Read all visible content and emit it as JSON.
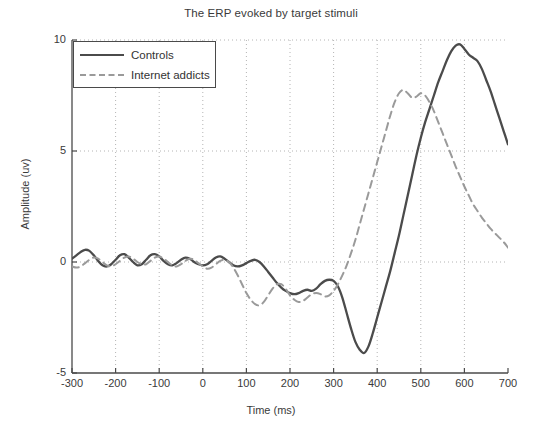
{
  "chart_data": {
    "type": "line",
    "title": "The ERP evoked by target stimuli",
    "xlabel": "Time (ms)",
    "ylabel": "Amplitude (uv)",
    "xlim": [
      -300,
      700
    ],
    "ylim": [
      -5,
      10
    ],
    "xticks": [
      -300,
      -200,
      -100,
      0,
      100,
      200,
      300,
      400,
      500,
      600,
      700
    ],
    "yticks": [
      -5,
      0,
      5,
      10
    ],
    "xtick_labels": [
      "-300",
      "-200",
      "-100",
      "0",
      "100",
      "200",
      "300",
      "400",
      "500",
      "600",
      "700"
    ],
    "ytick_labels": [
      "-5",
      "0",
      "5",
      "10"
    ],
    "grid": true,
    "grid_style": "dotted",
    "legend_position": "top-left",
    "series": [
      {
        "name": "Controls",
        "style": "solid",
        "color": "#4b4b4b",
        "x": [
          -300,
          -290,
          -280,
          -270,
          -260,
          -250,
          -240,
          -230,
          -220,
          -210,
          -200,
          -190,
          -180,
          -170,
          -160,
          -150,
          -140,
          -130,
          -120,
          -110,
          -100,
          -90,
          -80,
          -70,
          -60,
          -50,
          -40,
          -30,
          -20,
          -10,
          0,
          10,
          20,
          30,
          40,
          50,
          60,
          70,
          80,
          90,
          100,
          110,
          120,
          130,
          140,
          150,
          160,
          170,
          180,
          190,
          200,
          210,
          220,
          230,
          240,
          250,
          260,
          270,
          280,
          290,
          300,
          310,
          320,
          330,
          340,
          350,
          360,
          370,
          380,
          390,
          400,
          410,
          420,
          430,
          440,
          450,
          460,
          470,
          480,
          490,
          500,
          510,
          520,
          530,
          540,
          550,
          560,
          570,
          580,
          590,
          600,
          610,
          620,
          630,
          640,
          650,
          660,
          670,
          680,
          690,
          700
        ],
        "y": [
          0.15,
          0.3,
          0.45,
          0.55,
          0.5,
          0.3,
          0.05,
          -0.15,
          -0.2,
          -0.1,
          0.1,
          0.3,
          0.35,
          0.2,
          0.0,
          -0.15,
          -0.1,
          0.1,
          0.3,
          0.35,
          0.25,
          0.05,
          -0.1,
          -0.15,
          -0.05,
          0.1,
          0.2,
          0.15,
          0.0,
          -0.1,
          -0.15,
          -0.1,
          0.05,
          0.2,
          0.25,
          0.15,
          0.0,
          -0.15,
          -0.2,
          -0.15,
          -0.05,
          0.05,
          0.1,
          0.0,
          -0.2,
          -0.45,
          -0.7,
          -0.95,
          -1.15,
          -1.3,
          -1.4,
          -1.45,
          -1.4,
          -1.3,
          -1.25,
          -1.3,
          -1.2,
          -1.0,
          -0.85,
          -0.8,
          -0.85,
          -1.1,
          -1.6,
          -2.3,
          -3.0,
          -3.6,
          -3.95,
          -4.1,
          -3.8,
          -3.2,
          -2.5,
          -1.8,
          -1.1,
          -0.4,
          0.4,
          1.2,
          2.1,
          3.0,
          3.9,
          4.8,
          5.6,
          6.3,
          6.9,
          7.5,
          8.1,
          8.6,
          9.1,
          9.5,
          9.75,
          9.8,
          9.6,
          9.35,
          9.2,
          9.05,
          8.7,
          8.2,
          7.7,
          7.1,
          6.5,
          5.9,
          5.3
        ],
        "peak_label": "P300 peak ~9.8 uv near 400 ms",
        "trough_label": "N2 trough ~-4.1 uv near 160 ms"
      },
      {
        "name": "Internet addicts",
        "style": "dashed",
        "color": "#9a9a9a",
        "x": [
          -300,
          -290,
          -280,
          -270,
          -260,
          -250,
          -240,
          -230,
          -220,
          -210,
          -200,
          -190,
          -180,
          -170,
          -160,
          -150,
          -140,
          -130,
          -120,
          -110,
          -100,
          -90,
          -80,
          -70,
          -60,
          -50,
          -40,
          -30,
          -20,
          -10,
          0,
          10,
          20,
          30,
          40,
          50,
          60,
          70,
          80,
          90,
          100,
          110,
          120,
          130,
          140,
          150,
          160,
          170,
          180,
          190,
          200,
          210,
          220,
          230,
          240,
          250,
          260,
          270,
          280,
          290,
          300,
          310,
          320,
          330,
          340,
          350,
          360,
          370,
          380,
          390,
          400,
          410,
          420,
          430,
          440,
          450,
          460,
          470,
          480,
          490,
          500,
          510,
          520,
          530,
          540,
          550,
          560,
          570,
          580,
          590,
          600,
          610,
          620,
          630,
          640,
          650,
          660,
          670,
          680,
          690,
          700
        ],
        "y": [
          -0.2,
          -0.25,
          -0.2,
          -0.05,
          0.1,
          0.2,
          0.15,
          0.0,
          -0.15,
          -0.2,
          -0.1,
          0.05,
          0.2,
          0.25,
          0.15,
          0.0,
          -0.1,
          -0.1,
          0.05,
          0.2,
          0.25,
          0.15,
          0.0,
          -0.15,
          -0.2,
          -0.1,
          0.05,
          0.15,
          0.1,
          -0.05,
          -0.2,
          -0.3,
          -0.25,
          -0.1,
          0.05,
          0.1,
          0.0,
          -0.25,
          -0.6,
          -1.0,
          -1.4,
          -1.7,
          -1.9,
          -1.95,
          -1.8,
          -1.5,
          -1.2,
          -1.0,
          -1.0,
          -1.2,
          -1.5,
          -1.7,
          -1.8,
          -1.75,
          -1.6,
          -1.45,
          -1.4,
          -1.45,
          -1.55,
          -1.5,
          -1.3,
          -1.0,
          -0.6,
          -0.15,
          0.4,
          1.0,
          1.7,
          2.4,
          3.1,
          3.8,
          4.5,
          5.2,
          5.9,
          6.6,
          7.2,
          7.6,
          7.75,
          7.6,
          7.4,
          7.45,
          7.6,
          7.5,
          7.2,
          6.8,
          6.3,
          5.8,
          5.3,
          4.8,
          4.3,
          3.85,
          3.4,
          3.0,
          2.6,
          2.3,
          2.0,
          1.75,
          1.5,
          1.3,
          1.1,
          0.9,
          0.65
        ],
        "peak_label": "P300 peak ~7.8 uv near 430 ms"
      }
    ]
  },
  "legend": {
    "items": [
      {
        "label": "Controls"
      },
      {
        "label": "Internet addicts"
      }
    ]
  }
}
